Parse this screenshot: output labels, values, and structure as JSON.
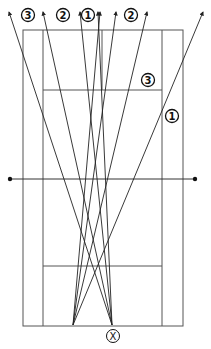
{
  "origin_marker": "X",
  "labels": {
    "top_left_3": "3",
    "top_left_2": "2",
    "top_center_1": "1",
    "top_right_2": "2",
    "side_3": "3",
    "side_1": "1"
  },
  "colors": {
    "line": "#222222",
    "court": "#555555",
    "background": "#ffffff"
  },
  "shots": {
    "from_right_origin": [
      "3",
      "2",
      "1",
      "1"
    ],
    "from_left_origin": [
      "1",
      "2",
      "2",
      "1"
    ]
  }
}
